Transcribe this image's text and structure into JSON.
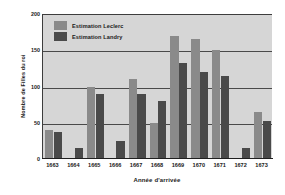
{
  "chart_data": {
    "type": "bar",
    "title": "",
    "xlabel": "Année d'arrivée",
    "ylabel": "Nombre de Filles du roi",
    "categories": [
      "1663",
      "1664",
      "1665",
      "1666",
      "1667",
      "1668",
      "1669",
      "1670",
      "1671",
      "1672",
      "1673"
    ],
    "series": [
      {
        "name": "Estimation Leclerc",
        "color": "#8a8a8a",
        "values": [
          40,
          0,
          100,
          0,
          110,
          50,
          170,
          165,
          150,
          0,
          65
        ]
      },
      {
        "name": "Estimation Landry",
        "color": "#4a4a4a",
        "values": [
          37,
          15,
          90,
          25,
          90,
          80,
          132,
          120,
          115,
          15,
          52
        ]
      }
    ],
    "ylim": [
      0,
      200
    ],
    "yticks": [
      0,
      50,
      100,
      150,
      200
    ],
    "ytick_labels": [
      "0",
      "50",
      "100",
      "150",
      "200"
    ],
    "grid": true,
    "legend_position": "top-left-inside",
    "plot_background": "#d6d6d6",
    "figure_background": "#ffffff"
  }
}
